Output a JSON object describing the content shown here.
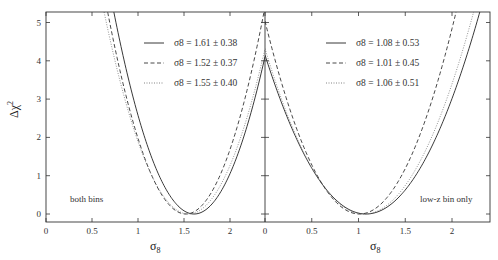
{
  "chart_data": [
    {
      "type": "line",
      "panel": "left",
      "annotation": "both bins",
      "xlabel": "σ8",
      "ylabel": "Δχ²",
      "xlim": [
        0,
        2.38
      ],
      "ylim": [
        -0.2,
        5.3
      ],
      "xticks": [
        "0",
        "0.5",
        "1",
        "1.5",
        "2"
      ],
      "yticks": [
        "0",
        "1",
        "2",
        "3",
        "4",
        "5"
      ],
      "grid": false,
      "legend_position": "upper right",
      "series": [
        {
          "name": "σ8 = 1.61 ± 0.38",
          "style": "solid",
          "mean": 1.61,
          "err": 0.38
        },
        {
          "name": "σ8 = 1.52 ± 0.37",
          "style": "dashed",
          "mean": 1.52,
          "err": 0.37
        },
        {
          "name": "σ8 = 1.55 ± 0.40",
          "style": "dotted",
          "mean": 1.55,
          "err": 0.4
        }
      ]
    },
    {
      "type": "line",
      "panel": "right",
      "annotation": "low-z bin only",
      "xlabel": "σ8",
      "ylabel": "",
      "xlim": [
        0,
        2.41
      ],
      "ylim": [
        -0.2,
        5.3
      ],
      "xticks": [
        "0",
        "0.5",
        "1",
        "1.5",
        "2"
      ],
      "yticks": [
        "0",
        "1",
        "2",
        "3",
        "4",
        "5"
      ],
      "grid": false,
      "legend_position": "upper right",
      "series": [
        {
          "name": "σ8 = 1.08 ± 0.53",
          "style": "solid",
          "mean": 1.08,
          "err": 0.53
        },
        {
          "name": "σ8 = 1.01 ± 0.45",
          "style": "dashed",
          "mean": 1.01,
          "err": 0.45
        },
        {
          "name": "σ8 = 1.06 ± 0.51",
          "style": "dotted",
          "mean": 1.06,
          "err": 0.51
        }
      ]
    }
  ],
  "labels": {
    "ylabel": "Δχ",
    "ylabel_sup": "2",
    "xlabel_left": "σ",
    "xlabel_left_sub": "8",
    "xlabel_right": "σ",
    "xlabel_right_sub": "8",
    "note_left": "both bins",
    "note_right": "low-z bin only"
  }
}
